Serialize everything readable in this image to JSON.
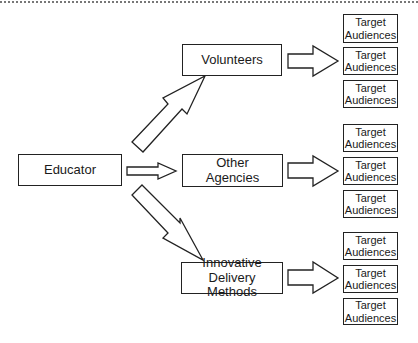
{
  "diagram": {
    "source": {
      "label": "Educator"
    },
    "channels": [
      {
        "label": "Volunteers",
        "targets": [
          "Target\nAudiences",
          "Target\nAudiences",
          "Target\nAudiences"
        ]
      },
      {
        "label": "Other\nAgencies",
        "targets": [
          "Target\nAudiences",
          "Target\nAudiences",
          "Target\nAudiences"
        ]
      },
      {
        "label": "Innovative\nDelivery Methods",
        "targets": [
          "Target\nAudiences",
          "Target\nAudiences",
          "Target\nAudiences"
        ]
      }
    ],
    "edges": [
      {
        "from": "Educator",
        "to": "Volunteers"
      },
      {
        "from": "Educator",
        "to": "Other Agencies"
      },
      {
        "from": "Educator",
        "to": "Innovative Delivery Methods"
      },
      {
        "from": "Volunteers",
        "to": "Target Audiences"
      },
      {
        "from": "Other Agencies",
        "to": "Target Audiences"
      },
      {
        "from": "Innovative Delivery Methods",
        "to": "Target Audiences"
      }
    ]
  }
}
